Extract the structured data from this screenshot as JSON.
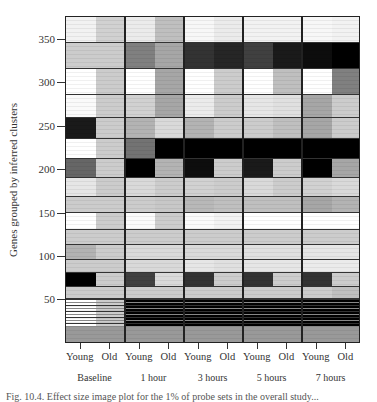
{
  "chart_data": {
    "type": "heatmap",
    "title": "",
    "ylabel": "Genes grouped by inferred clusters",
    "xlabel": "",
    "ylim": [
      0,
      375
    ],
    "yticks": [
      50,
      100,
      150,
      200,
      250,
      300,
      350
    ],
    "grid": false,
    "legend": null,
    "columns": [
      "Young",
      "Old",
      "Young",
      "Old",
      "Young",
      "Old",
      "Young",
      "Old",
      "Young",
      "Old"
    ],
    "groups": [
      "Baseline",
      "1 hour",
      "3 hours",
      "5 hours",
      "7 hours"
    ],
    "value_scale": "grayscale 0 (white) to 1 (black), approximate intensity",
    "clusters": [
      {
        "y_range": [
          350,
          375
        ],
        "values": [
          0.05,
          0.18,
          0.08,
          0.25,
          0.03,
          0.08,
          0.05,
          0.05,
          0.03,
          0.05
        ]
      },
      {
        "y_range": [
          325,
          350
        ],
        "values": [
          0.2,
          0.2,
          0.5,
          0.35,
          0.8,
          0.85,
          0.75,
          0.9,
          0.95,
          1.0
        ]
      },
      {
        "y_range": [
          300,
          325
        ],
        "values": [
          0.0,
          0.2,
          0.0,
          0.35,
          0.0,
          0.2,
          0.0,
          0.25,
          0.0,
          0.5
        ]
      },
      {
        "y_range": [
          278,
          300
        ],
        "values": [
          0.02,
          0.2,
          0.18,
          0.35,
          0.08,
          0.2,
          0.1,
          0.12,
          0.35,
          0.2
        ]
      },
      {
        "y_range": [
          258,
          278
        ],
        "values": [
          0.9,
          0.2,
          0.3,
          0.15,
          0.3,
          0.2,
          0.2,
          0.25,
          0.35,
          0.2
        ]
      },
      {
        "y_range": [
          239,
          258
        ],
        "values": [
          0.0,
          0.2,
          0.55,
          1.0,
          1.0,
          1.0,
          1.0,
          1.0,
          1.0,
          1.0
        ]
      },
      {
        "y_range": [
          221,
          239
        ],
        "values": [
          0.6,
          0.2,
          1.0,
          0.3,
          0.95,
          0.2,
          0.9,
          0.2,
          1.0,
          0.35
        ]
      },
      {
        "y_range": [
          203,
          221
        ],
        "values": [
          0.1,
          0.2,
          0.15,
          0.2,
          0.18,
          0.2,
          0.15,
          0.2,
          0.18,
          0.15
        ]
      },
      {
        "y_range": [
          187,
          203
        ],
        "values": [
          0.2,
          0.2,
          0.2,
          0.22,
          0.28,
          0.25,
          0.25,
          0.25,
          0.35,
          0.3
        ]
      },
      {
        "y_range": [
          171,
          187
        ],
        "values": [
          0.0,
          0.2,
          0.02,
          0.2,
          0.02,
          0.05,
          0.0,
          0.0,
          0.0,
          0.0
        ]
      },
      {
        "y_range": [
          157,
          171
        ],
        "values": [
          0.2,
          0.2,
          0.2,
          0.2,
          0.2,
          0.2,
          0.2,
          0.2,
          0.2,
          0.2
        ]
      },
      {
        "y_range": [
          142,
          157
        ],
        "values": [
          0.3,
          0.2,
          0.15,
          0.15,
          0.15,
          0.15,
          0.12,
          0.12,
          0.1,
          0.1
        ]
      },
      {
        "y_range": [
          130,
          142
        ],
        "values": [
          0.2,
          0.2,
          0.15,
          0.15,
          0.1,
          0.12,
          0.1,
          0.1,
          0.08,
          0.08
        ]
      },
      {
        "y_range": [
          117,
          130
        ],
        "values": [
          1.0,
          0.2,
          0.75,
          0.15,
          0.8,
          0.2,
          0.8,
          0.2,
          0.8,
          0.2
        ]
      },
      {
        "y_range": [
          105,
          117
        ],
        "values": [
          0.2,
          0.2,
          0.2,
          0.2,
          0.2,
          0.2,
          0.2,
          0.2,
          0.2,
          0.25
        ]
      },
      {
        "y_range": [
          78,
          105
        ],
        "values": [
          0.0,
          0.2,
          1.0,
          1.0,
          1.0,
          1.0,
          1.0,
          1.0,
          1.0,
          1.0
        ]
      },
      {
        "y_range": [
          16,
          78
        ],
        "values": [
          0.4,
          0.4,
          0.4,
          0.4,
          0.4,
          0.4,
          0.4,
          0.4,
          0.4,
          0.4
        ],
        "note": "thin striped clusters"
      },
      {
        "y_range": [
          0,
          16
        ],
        "values": [
          1.0,
          1.0,
          1.0,
          1.0,
          1.0,
          1.0,
          1.0,
          1.0,
          1.0,
          1.0
        ]
      }
    ]
  },
  "layout_rows": [
    {
      "top": 0,
      "h": 26
    },
    {
      "top": 26,
      "h": 26
    },
    {
      "top": 52,
      "h": 26
    },
    {
      "top": 78,
      "h": 23
    },
    {
      "top": 101,
      "h": 21
    },
    {
      "top": 122,
      "h": 20
    },
    {
      "top": 142,
      "h": 19
    },
    {
      "top": 161,
      "h": 19
    },
    {
      "top": 180,
      "h": 16
    },
    {
      "top": 196,
      "h": 17
    },
    {
      "top": 213,
      "h": 15
    },
    {
      "top": 228,
      "h": 15
    },
    {
      "top": 243,
      "h": 13
    },
    {
      "top": 256,
      "h": 14
    },
    {
      "top": 270,
      "h": 12
    },
    {
      "top": 282,
      "h": 28
    },
    {
      "top": 310,
      "h": 17
    }
  ],
  "axis": {
    "ytick_labels": [
      "350",
      "300",
      "250",
      "200",
      "150",
      "100",
      "50"
    ],
    "xtick_labels": [
      "Young",
      "Old",
      "Young",
      "Old",
      "Young",
      "Old",
      "Young",
      "Old",
      "Young",
      "Old"
    ],
    "group_labels": [
      "Baseline",
      "1 hour",
      "3 hours",
      "5 hours",
      "7 hours"
    ],
    "ylabel": "Genes grouped by inferred clusters"
  },
  "caption": "Fig. 10.4. Effect size image plot for the 1% of probe sets in the overall study..."
}
